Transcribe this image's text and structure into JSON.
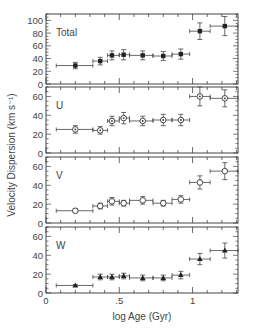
{
  "chart_data": {
    "type": "scatter",
    "title": "",
    "xlabel": "log Age (Gyr)",
    "ylabel": "Velocity Dispersion (km s⁻¹)",
    "xlim": [
      0,
      1.31
    ],
    "x_ticks": [
      "0",
      ".5",
      "1"
    ],
    "x_tick_values": [
      0,
      0.5,
      1
    ],
    "bins": [
      {
        "x": 0.2,
        "xlo": 0.07,
        "xhi": 0.32
      },
      {
        "x": 0.37,
        "xlo": 0.32,
        "xhi": 0.42
      },
      {
        "x": 0.45,
        "xlo": 0.42,
        "xhi": 0.5
      },
      {
        "x": 0.53,
        "xlo": 0.5,
        "xhi": 0.57
      },
      {
        "x": 0.66,
        "xlo": 0.57,
        "xhi": 0.73
      },
      {
        "x": 0.8,
        "xlo": 0.73,
        "xhi": 0.86
      },
      {
        "x": 0.92,
        "xlo": 0.86,
        "xhi": 0.98
      },
      {
        "x": 1.05,
        "xlo": 0.98,
        "xhi": 1.12
      },
      {
        "x": 1.22,
        "xlo": 1.12,
        "xhi": 1.31
      }
    ],
    "panels": [
      {
        "name": "Total",
        "marker": "filled-square",
        "ylim": [
          0,
          110
        ],
        "y_ticks": [
          0,
          20,
          40,
          60,
          80,
          100
        ],
        "values": [
          29,
          36,
          45,
          46,
          45,
          44,
          47,
          83,
          91
        ],
        "yerr": [
          5,
          6,
          7,
          8,
          7,
          7,
          8,
          13,
          15
        ]
      },
      {
        "name": "U",
        "marker": "open-circle-dot",
        "ylim": [
          0,
          70
        ],
        "y_ticks": [
          0,
          20,
          40,
          60
        ],
        "values": [
          25,
          24,
          34,
          37,
          34,
          35,
          35,
          60,
          58
        ],
        "yerr": [
          4,
          4,
          5,
          6,
          5,
          6,
          6,
          10,
          9
        ]
      },
      {
        "name": "V",
        "marker": "open-circle",
        "ylim": [
          0,
          70
        ],
        "y_ticks": [
          0,
          20,
          40,
          60
        ],
        "values": [
          13,
          18,
          23,
          21,
          24,
          21,
          25,
          43,
          55
        ],
        "yerr": [
          2,
          3,
          4,
          3,
          4,
          3,
          4,
          7,
          9
        ]
      },
      {
        "name": "W",
        "marker": "filled-triangle",
        "ylim": [
          0,
          70
        ],
        "y_ticks": [
          0,
          20,
          40,
          60
        ],
        "values": [
          8,
          17,
          17,
          18,
          16,
          16,
          19,
          36,
          45
        ],
        "yerr": [
          1,
          3,
          3,
          3,
          3,
          3,
          4,
          6,
          8
        ]
      }
    ]
  }
}
